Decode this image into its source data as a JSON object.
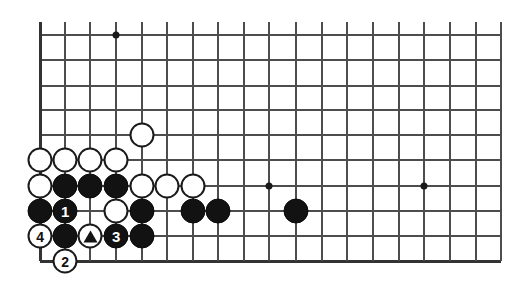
{
  "diagram": {
    "type": "go-board-problem-diagram",
    "title": "",
    "board_size": 19,
    "view": {
      "columns_visible": 19,
      "rows_visible": 10,
      "region": "bottom-left corner, lower portion of board",
      "grid_color": "#4d4d4d",
      "background_color": "#ffffff",
      "star_point_color": "#1a1a1a"
    },
    "geometry": {
      "col_x": [
        40,
        65,
        90,
        116,
        142,
        167,
        193,
        218,
        244,
        269,
        296,
        322,
        347,
        373,
        399,
        424,
        450,
        476,
        501
      ],
      "row_y": [
        35,
        60,
        86,
        110,
        135,
        160,
        186,
        211,
        236,
        261
      ],
      "cell_px": 25,
      "stone_diameter_px": 25
    },
    "star_points": [
      {
        "col": 3,
        "row": 0
      },
      {
        "col": 9,
        "row": 6
      },
      {
        "col": 15,
        "row": 6
      }
    ],
    "stones": [
      {
        "col": 4,
        "row": 4,
        "color": "white",
        "label": "",
        "marker": "none"
      },
      {
        "col": 0,
        "row": 5,
        "color": "white",
        "label": "",
        "marker": "none"
      },
      {
        "col": 1,
        "row": 5,
        "color": "white",
        "label": "",
        "marker": "none"
      },
      {
        "col": 2,
        "row": 5,
        "color": "white",
        "label": "",
        "marker": "none"
      },
      {
        "col": 3,
        "row": 5,
        "color": "white",
        "label": "",
        "marker": "none"
      },
      {
        "col": 0,
        "row": 6,
        "color": "white",
        "label": "",
        "marker": "none"
      },
      {
        "col": 1,
        "row": 6,
        "color": "black",
        "label": "",
        "marker": "none"
      },
      {
        "col": 2,
        "row": 6,
        "color": "black",
        "label": "",
        "marker": "none"
      },
      {
        "col": 3,
        "row": 6,
        "color": "black",
        "label": "",
        "marker": "none"
      },
      {
        "col": 4,
        "row": 6,
        "color": "white",
        "label": "",
        "marker": "none"
      },
      {
        "col": 5,
        "row": 6,
        "color": "white",
        "label": "",
        "marker": "none"
      },
      {
        "col": 6,
        "row": 6,
        "color": "white",
        "label": "",
        "marker": "none"
      },
      {
        "col": 0,
        "row": 7,
        "color": "black",
        "label": "",
        "marker": "none"
      },
      {
        "col": 1,
        "row": 7,
        "color": "black",
        "label": "1",
        "marker": "number"
      },
      {
        "col": 3,
        "row": 7,
        "color": "white",
        "label": "",
        "marker": "none"
      },
      {
        "col": 4,
        "row": 7,
        "color": "black",
        "label": "",
        "marker": "none"
      },
      {
        "col": 6,
        "row": 7,
        "color": "black",
        "label": "",
        "marker": "none"
      },
      {
        "col": 7,
        "row": 7,
        "color": "black",
        "label": "",
        "marker": "none"
      },
      {
        "col": 10,
        "row": 7,
        "color": "black",
        "label": "",
        "marker": "none"
      },
      {
        "col": 0,
        "row": 8,
        "color": "white",
        "label": "4",
        "marker": "number"
      },
      {
        "col": 1,
        "row": 8,
        "color": "black",
        "label": "",
        "marker": "none"
      },
      {
        "col": 2,
        "row": 8,
        "color": "white",
        "label": "",
        "marker": "triangle"
      },
      {
        "col": 3,
        "row": 8,
        "color": "black",
        "label": "3",
        "marker": "number"
      },
      {
        "col": 4,
        "row": 8,
        "color": "black",
        "label": "",
        "marker": "none"
      },
      {
        "col": 1,
        "row": 9,
        "color": "white",
        "label": "2",
        "marker": "number"
      }
    ],
    "move_sequence": [
      {
        "number": "1",
        "color": "black",
        "col": 1,
        "row": 7
      },
      {
        "number": "2",
        "color": "white",
        "col": 1,
        "row": 9
      },
      {
        "number": "3",
        "color": "black",
        "col": 3,
        "row": 8
      },
      {
        "number": "4",
        "color": "white",
        "col": 0,
        "row": 8
      }
    ],
    "markers": [
      {
        "symbol": "triangle",
        "color": "white-stone",
        "col": 2,
        "row": 8,
        "name": "triangle-marked-white-stone"
      }
    ]
  }
}
